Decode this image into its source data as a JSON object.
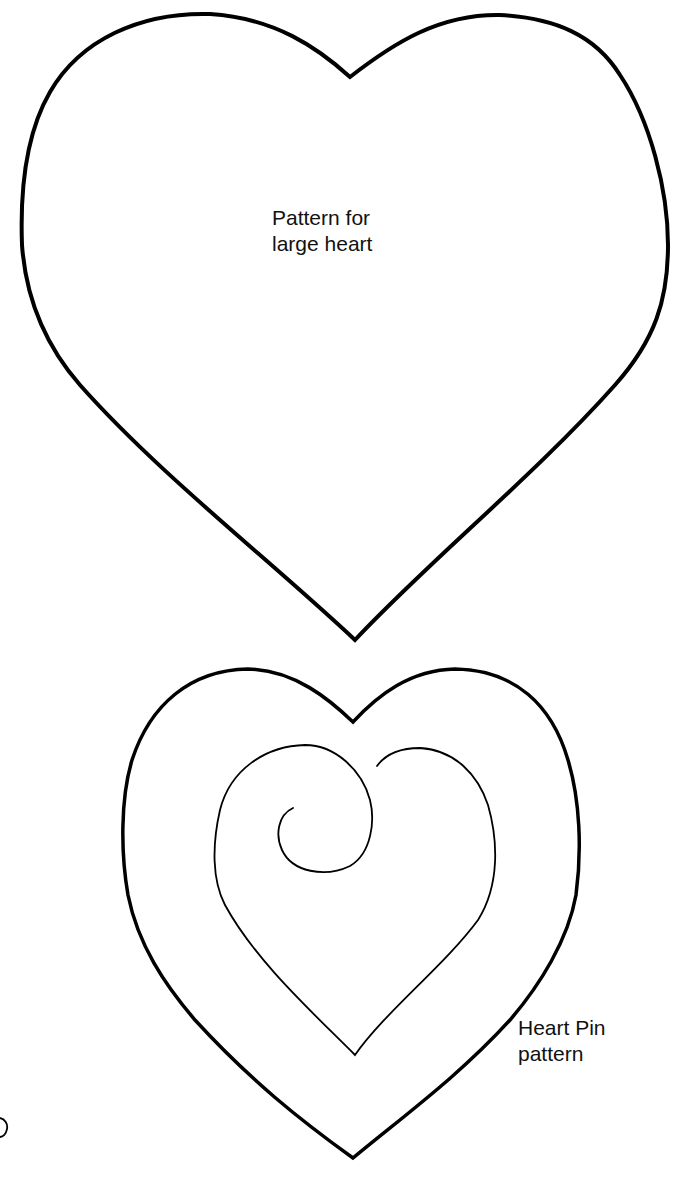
{
  "large_heart": {
    "label_line1": "Pattern for",
    "label_line2": "large heart"
  },
  "heart_pin": {
    "label_line1": "Heart Pin",
    "label_line2": "pattern"
  },
  "colors": {
    "stroke": "#000000",
    "background": "#ffffff",
    "text": "#111111"
  }
}
